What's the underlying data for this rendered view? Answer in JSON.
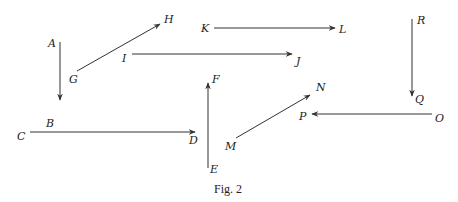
{
  "figure": {
    "caption": "Fig. 2",
    "stroke_color": "#333333"
  },
  "points": {
    "A": "A",
    "B": "B",
    "C": "C",
    "D": "D",
    "E": "E",
    "F": "F",
    "G": "G",
    "H": "H",
    "I": "I",
    "J": "J",
    "K": "K",
    "L": "L",
    "M": "M",
    "N": "N",
    "O": "O",
    "P": "P",
    "Q": "Q",
    "R": "R"
  },
  "arrows": [
    {
      "from": "A",
      "to": "B",
      "direction": "down"
    },
    {
      "from": "C",
      "to": "D",
      "direction": "right"
    },
    {
      "from": "E",
      "to": "F",
      "direction": "up"
    },
    {
      "from": "G",
      "to": "H",
      "direction": "up-right"
    },
    {
      "from": "I",
      "to": "J",
      "direction": "right"
    },
    {
      "from": "K",
      "to": "L",
      "direction": "right"
    },
    {
      "from": "M",
      "to": "N",
      "direction": "up-right"
    },
    {
      "from": "O",
      "to": "P",
      "direction": "left"
    },
    {
      "from": "R",
      "to": "Q",
      "direction": "down"
    }
  ]
}
